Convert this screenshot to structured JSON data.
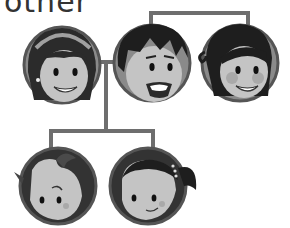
{
  "heading": {
    "text": "other"
  },
  "colors": {
    "connector": "#6e6e6e",
    "ring": "#555555",
    "background_fill": "#8a8a8a",
    "skin": "#c4c4c4",
    "hair_dark": "#1e1e1e",
    "hair_brown": "#4a4a4a",
    "cheek": "#a9a9a9"
  },
  "members": [
    {
      "id": "mother",
      "label": "Mother",
      "cx": 62,
      "cy": 65
    },
    {
      "id": "father",
      "label": "Father",
      "cx": 152,
      "cy": 63
    },
    {
      "id": "aunt",
      "label": "Aunt",
      "cx": 240,
      "cy": 63
    },
    {
      "id": "son",
      "label": "Son",
      "cx": 58,
      "cy": 186
    },
    {
      "id": "daughter",
      "label": "Daughter",
      "cx": 148,
      "cy": 186
    }
  ]
}
